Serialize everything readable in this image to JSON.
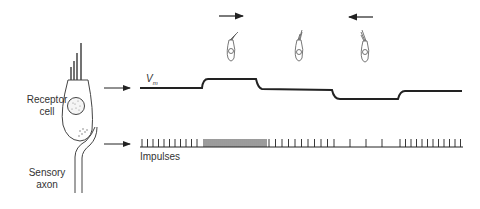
{
  "labels": {
    "receptor_cell": [
      "Receptor",
      "cell"
    ],
    "sensory_axon": [
      "Sensory",
      "axon"
    ],
    "vm": "V",
    "vm_sub": "m",
    "impulses": "Impulses"
  },
  "stimulus": [
    {
      "position": "left",
      "deflection": "toward-tallest",
      "arrow": "right"
    },
    {
      "position": "center",
      "deflection": "rest",
      "arrow": "none"
    },
    {
      "position": "right",
      "deflection": "away-from-tallest",
      "arrow": "left"
    }
  ],
  "traces": {
    "membrane_potential": [
      "rest",
      "depolarized",
      "rest",
      "hyperpolarized",
      "rest"
    ],
    "impulse_rate": [
      "baseline",
      "increased",
      "baseline",
      "decreased",
      "baseline"
    ]
  }
}
